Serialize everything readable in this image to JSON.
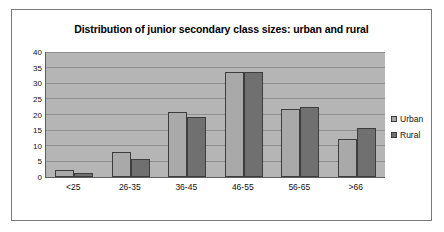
{
  "chart_data": {
    "type": "bar",
    "title": "Distribution of junior secondary class sizes: urban and rural",
    "xlabel": "",
    "ylabel": "",
    "categories": [
      "<25",
      "26-35",
      "36-45",
      "46-55",
      "56-65",
      ">66"
    ],
    "series": [
      {
        "name": "Urban",
        "color": "#a9a9a9",
        "values": [
          2.3,
          8.1,
          20.8,
          33.7,
          21.8,
          12.1
        ]
      },
      {
        "name": "Rural",
        "color": "#707070",
        "values": [
          1.4,
          5.9,
          19.3,
          33.7,
          22.3,
          15.6
        ]
      }
    ],
    "ylim": [
      0,
      40
    ],
    "yticks": [
      0,
      5,
      10,
      15,
      20,
      25,
      30,
      35,
      40
    ],
    "ytick_labels": [
      "0",
      "5",
      "10",
      "15",
      "20",
      "25",
      "30",
      "35",
      "40"
    ],
    "grid": true,
    "legend_position": "right",
    "plot_background": "#b5b5b5",
    "axis_color": "#5e5e5e",
    "gridline_color": "#8f8f8f",
    "frame_border_color": "#7a7a7a"
  }
}
